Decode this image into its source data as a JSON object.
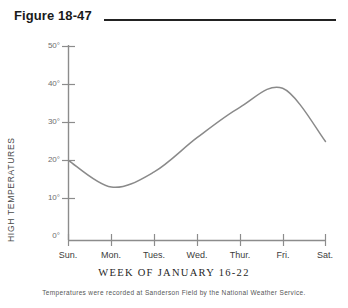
{
  "figure": {
    "label": "Figure 18-47",
    "caption": "Temperatures were recorded at Sanderson Field by the National Weather Service."
  },
  "chart_data": {
    "type": "line",
    "title": "Figure 18-47",
    "subtitle": "",
    "xlabel": "WEEK OF JANUARY 16-22",
    "ylabel": "HIGH TEMPERATURES",
    "categories": [
      "Sun.",
      "Mon.",
      "Tues.",
      "Wed.",
      "Thur.",
      "Fri.",
      "Sat."
    ],
    "x": [
      0,
      1,
      2,
      3,
      4,
      5,
      6
    ],
    "values": [
      20,
      13,
      17,
      26,
      34,
      39,
      25
    ],
    "series": [
      {
        "name": "High temperature",
        "values": [
          20,
          13,
          17,
          26,
          34,
          39,
          25
        ]
      }
    ],
    "ytick_labels": [
      "50°",
      "40°",
      "30°",
      "20°",
      "10°",
      "0°"
    ],
    "ytick_values": [
      50,
      40,
      30,
      20,
      10,
      0
    ],
    "xtick_labels": [
      "Sun.",
      "Mon.",
      "Tues.",
      "Wed.",
      "Thur.",
      "Fri.",
      "Sat."
    ],
    "ylim": [
      0,
      50
    ],
    "xlim": [
      0,
      6
    ],
    "grid": false,
    "legend": false,
    "legend_position": "none",
    "line_color": "#8a8a8a",
    "axis_color": "#8c8c8c",
    "smoothing": "spline",
    "annotations": []
  },
  "colors": {
    "title_text": "#1a1a1a",
    "rule": "#222222",
    "axis": "#8c8c8c",
    "curve": "#8a8a8a",
    "tick_text": "#6e6e6e",
    "caption_text": "#555555",
    "background": "#ffffff"
  }
}
